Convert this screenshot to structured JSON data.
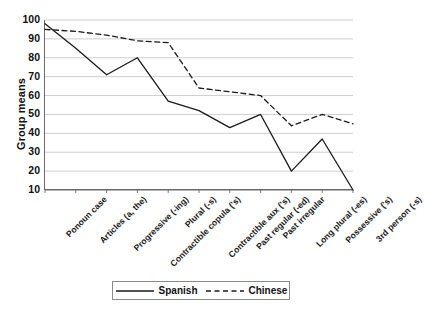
{
  "chart_data": {
    "type": "line",
    "title": "",
    "xlabel": "",
    "ylabel": "Group means",
    "ylim": [
      10,
      100
    ],
    "ytick_step": 10,
    "yticks": [
      100,
      90,
      80,
      70,
      60,
      50,
      40,
      30,
      20,
      10
    ],
    "grid": true,
    "grid_axis": "y",
    "legend_position": "bottom",
    "categories": [
      "Ponoun case",
      "Articles (a, the)",
      "Progressive (-ing)",
      "Contractible copula ('s)",
      "Plural (-s)",
      "Contractible aux ('s)",
      "Past regular (-ed)",
      "Past irregular",
      "Long plural (-es)",
      "Possessive ('s)",
      "3rd person (-s)"
    ],
    "series": [
      {
        "name": "Spanish",
        "style": "solid",
        "color": "#1a1a1a",
        "values": [
          98,
          85,
          71,
          80,
          57,
          52,
          43,
          50,
          20,
          37,
          10
        ]
      },
      {
        "name": "Chinese",
        "style": "dashed",
        "color": "#1a1a1a",
        "values": [
          95,
          94,
          92,
          89,
          88,
          64,
          62,
          60,
          44,
          50,
          45
        ]
      }
    ]
  },
  "legend": {
    "items": [
      {
        "label": "Spanish",
        "style": "solid"
      },
      {
        "label": "Chinese",
        "style": "dashed"
      }
    ]
  }
}
